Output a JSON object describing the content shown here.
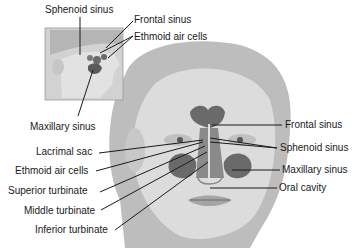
{
  "diagram": {
    "inset": {
      "view": "lateral head",
      "labels": [
        {
          "id": "sphenoid",
          "text": "Sphenoid sinus"
        },
        {
          "id": "frontal",
          "text": "Frontal sinus"
        },
        {
          "id": "ethmoid",
          "text": "Ethmoid air cells"
        },
        {
          "id": "maxillary",
          "text": "Maxillary sinus"
        }
      ]
    },
    "front": {
      "view": "frontal face",
      "left_labels": [
        {
          "id": "lacrimal",
          "text": "Lacrimal sac"
        },
        {
          "id": "ethmoid",
          "text": "Ethmoid air cells"
        },
        {
          "id": "superior_turbinate",
          "text": "Superior turbinate"
        },
        {
          "id": "middle_turbinate",
          "text": "Middle turbinate"
        },
        {
          "id": "inferior_turbinate",
          "text": "Inferior turbinate"
        }
      ],
      "right_labels": [
        {
          "id": "frontal",
          "text": "Frontal sinus"
        },
        {
          "id": "sphenoid",
          "text": "Sphenoid sinus"
        },
        {
          "id": "maxillary",
          "text": "Maxillary sinus"
        },
        {
          "id": "oral_cavity",
          "text": "Oral cavity"
        }
      ]
    },
    "colors": {
      "background": "#ffffff",
      "skin_light": "#d9d9d9",
      "skin_mid": "#b8b8b8",
      "hair": "#a9a9a9",
      "sinus_dark": "#5a5a5a",
      "leader_line": "#1a1a1a",
      "text": "#1a1a1a"
    }
  }
}
